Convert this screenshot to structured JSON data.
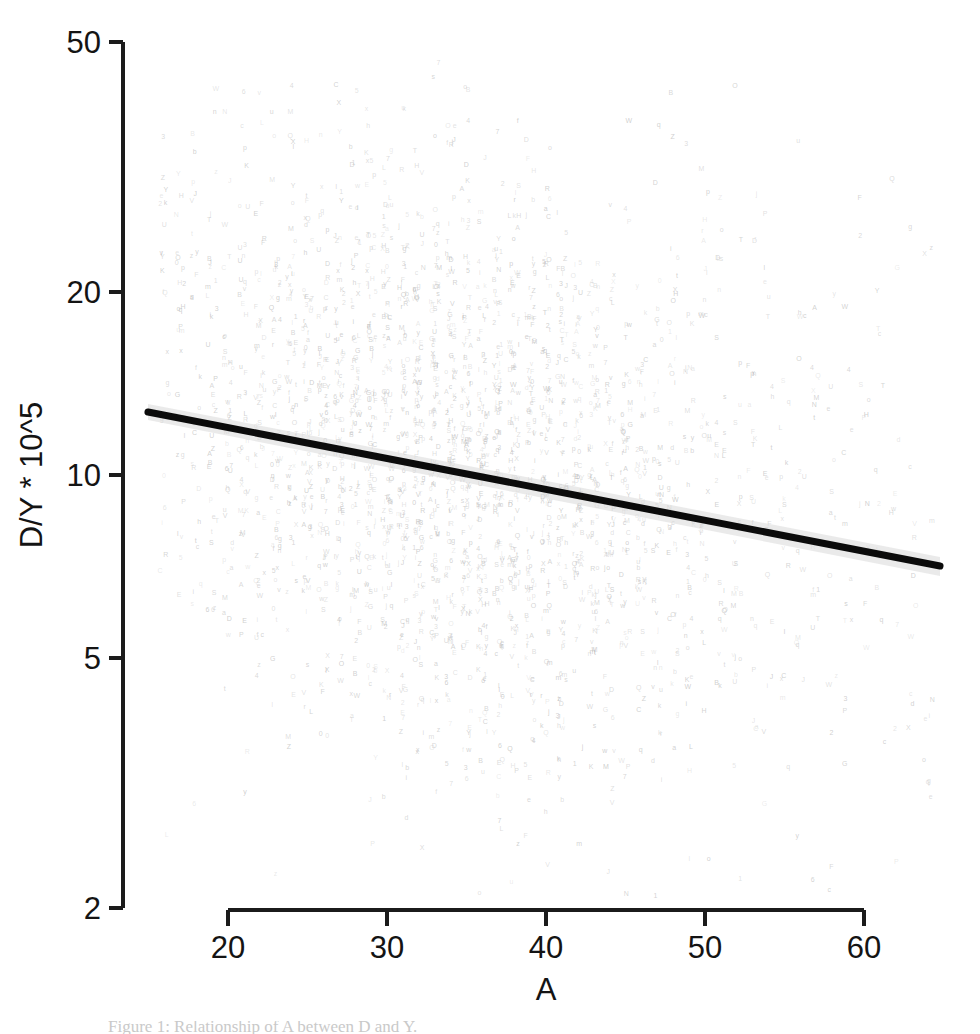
{
  "figure": {
    "background_color": "#ffffff",
    "width": 980,
    "height": 1034
  },
  "caption": {
    "partial_text": "Figure 1: Relationship of A between D and Y."
  },
  "chart_data": {
    "type": "scatter",
    "title": "",
    "subtitle": "",
    "xlabel": "A",
    "ylabel": "D/Y * 10^5",
    "xlim": [
      15.0,
      64.5
    ],
    "ylim": [
      2.0,
      50.0
    ],
    "x_scale": "linear",
    "y_scale": "log",
    "grid": false,
    "legend": null,
    "legend_position": "none",
    "xticks": [
      20,
      30,
      40,
      50,
      60
    ],
    "xticklabels": [
      "20",
      "30",
      "40",
      "50",
      "60"
    ],
    "yticks": [
      2,
      5,
      10,
      20,
      50
    ],
    "yticklabels": [
      "2",
      "5",
      "10",
      "20",
      "50"
    ],
    "marker_style": "text-glyph",
    "marker_color": "#b9b9b9",
    "marker_count_approx": 2600,
    "annotations": [],
    "series": [
      {
        "name": "observations",
        "type": "scatter",
        "color": "#b9b9b9",
        "n_points": 2600,
        "x_range": [
          15.5,
          64.0
        ],
        "y_range": [
          2.1,
          46.0
        ],
        "note": "Dense cloud of very faint grey text-glyph markers arranged in vertical columns at integer values of A; densest between A=25 and A=45, thinning toward both tails."
      },
      {
        "name": "fitted regression line",
        "type": "line",
        "color": "#0b0b0b",
        "line_width": 7,
        "x": [
          15.3,
          64.5
        ],
        "y": [
          13.6,
          7.6
        ],
        "note": "Downward-sloping linear fit on the log y-axis, drawn with a narrow light-grey confidence band."
      },
      {
        "name": "confidence band",
        "type": "area",
        "color": "#d8d8d8",
        "note": "Thin grey ribbon hugging the regression line, widest near the right tail."
      }
    ]
  },
  "axes": {
    "y_axis": {
      "line_x": 123,
      "top_y": 42,
      "bottom_y": 908,
      "tick_length": 14
    },
    "x_axis": {
      "line_y": 910,
      "left_x": 228,
      "right_x": 864,
      "tick_length": 16
    }
  }
}
